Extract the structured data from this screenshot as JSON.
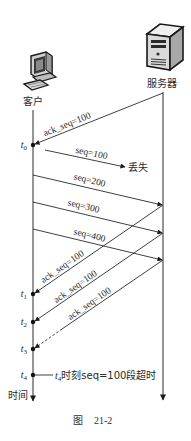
{
  "actors": {
    "client": {
      "label": "客户",
      "icon": "computer-icon"
    },
    "server": {
      "label": "服务器",
      "icon": "server-icon"
    }
  },
  "timeline": {
    "axis_label": "时间"
  },
  "time_points": [
    {
      "var": "t",
      "sub": "0"
    },
    {
      "var": "t",
      "sub": "1"
    },
    {
      "var": "t",
      "sub": "2"
    },
    {
      "var": "t",
      "sub": "3"
    },
    {
      "var": "t",
      "sub": "4"
    }
  ],
  "messages": [
    {
      "direction": "server-to-client",
      "label": "ack_seq=100"
    },
    {
      "direction": "client-to-server",
      "label": "seq=100",
      "status": "丢失"
    },
    {
      "direction": "client-to-server",
      "label": "seq=200"
    },
    {
      "direction": "client-to-server",
      "label": "seq=300"
    },
    {
      "direction": "client-to-server",
      "label": "seq=400"
    },
    {
      "direction": "server-to-client",
      "label": "ack_seq=100"
    },
    {
      "direction": "server-to-client",
      "label": "ack_seq=100"
    },
    {
      "direction": "server-to-client",
      "label": "ack_seq=100"
    }
  ],
  "timeout_note": {
    "var": "t",
    "sub": "4",
    "text": "时刻seq=100段超时"
  },
  "figure": {
    "caption_prefix": "图",
    "caption_number": "21-2"
  }
}
